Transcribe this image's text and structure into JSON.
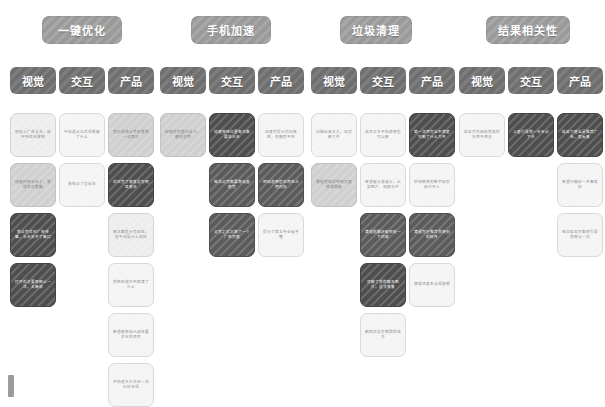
{
  "board": {
    "title": "产品体验亲和图",
    "groups": [
      {
        "label": "一键优化",
        "x": 42,
        "width": 80
      },
      {
        "label": "手机加速",
        "x": 191,
        "width": 80
      },
      {
        "label": "垃圾清理",
        "x": 340,
        "width": 72
      },
      {
        "label": "结果相关性",
        "x": 486,
        "width": 84
      }
    ],
    "columns": [
      {
        "label": "视觉",
        "x": 10
      },
      {
        "label": "交互",
        "x": 59
      },
      {
        "label": "产品",
        "x": 108
      },
      {
        "label": "视觉",
        "x": 160
      },
      {
        "label": "交互",
        "x": 209
      },
      {
        "label": "产品",
        "x": 258
      },
      {
        "label": "视觉",
        "x": 311
      },
      {
        "label": "交互",
        "x": 360
      },
      {
        "label": "产品",
        "x": 409
      },
      {
        "label": "视觉",
        "x": 459
      },
      {
        "label": "交互",
        "x": 508
      },
      {
        "label": "产品",
        "x": 557
      }
    ],
    "notes": [
      {
        "x": 10,
        "y": 113,
        "shade": "light",
        "text": "视觉上广告太多，找不到优化按钮"
      },
      {
        "x": 10,
        "y": 163,
        "shade": "mid",
        "text": "动画时间太长了，等得有点焦躁"
      },
      {
        "x": 10,
        "y": 213,
        "shade": "darker",
        "text": "我点完优化广告弹窗，半天关不了窗口"
      },
      {
        "x": 10,
        "y": 263,
        "shade": "darker",
        "text": "打开后还要再确认一次，太麻烦"
      },
      {
        "x": 59,
        "y": 113,
        "shade": "lightest",
        "text": "不知道点击后系统做了什么"
      },
      {
        "x": 59,
        "y": 163,
        "shade": "lightest",
        "text": "按钮点了没反应"
      },
      {
        "x": 108,
        "y": 113,
        "shade": "mid",
        "text": "我只是想让手机变快一点而已"
      },
      {
        "x": 108,
        "y": 163,
        "shade": "darker",
        "text": "优化完了速度没有明显变化"
      },
      {
        "x": 108,
        "y": 213,
        "shade": "light",
        "text": "每次都提示有风险，但不说是什么风险"
      },
      {
        "x": 108,
        "y": 263,
        "shade": "lightest",
        "text": "我想知道它到底清了什么"
      },
      {
        "x": 108,
        "y": 313,
        "shade": "lightest",
        "text": "希望能够自己选择要优化的项目"
      },
      {
        "x": 108,
        "y": 363,
        "shade": "lightest",
        "text": "不知道多久优化一次比较合适"
      },
      {
        "x": 160,
        "y": 113,
        "shade": "mid",
        "text": "加速后页面还是卡，感觉没用"
      },
      {
        "x": 209,
        "y": 113,
        "shade": "darker",
        "text": "加速按钮位置每次都要找半天"
      },
      {
        "x": 209,
        "y": 163,
        "shade": "dark",
        "text": "每次点完都要等动画跑完"
      },
      {
        "x": 209,
        "y": 213,
        "shade": "dark",
        "text": "点完之后又跳了一个广告页面"
      },
      {
        "x": 258,
        "y": 113,
        "shade": "lightest",
        "text": "加速完提示内存释放，但感受不到"
      },
      {
        "x": 258,
        "y": 163,
        "shade": "dark",
        "text": "想知道哪些应用在占用内存"
      },
      {
        "x": 258,
        "y": 213,
        "shade": "lightest",
        "text": "提示文案太专业看不懂"
      },
      {
        "x": 311,
        "y": 113,
        "shade": "lightest",
        "text": "扫描出来太大，怕误删文件"
      },
      {
        "x": 311,
        "y": 163,
        "shade": "mid",
        "text": "清理完成后空间又很快满回来"
      },
      {
        "x": 360,
        "y": 113,
        "shade": "lightest",
        "text": "选项太多不知道哪些可以删"
      },
      {
        "x": 360,
        "y": 163,
        "shade": "lightest",
        "text": "希望能分类展示，比如图片、视频分开"
      },
      {
        "x": 360,
        "y": 213,
        "shade": "dark",
        "text": "清理前最好能预览一下内容"
      },
      {
        "x": 360,
        "y": 263,
        "shade": "darker",
        "text": "误删了我的聊天图片，没法恢复"
      },
      {
        "x": 360,
        "y": 313,
        "shade": "lightest",
        "text": "删除后没有撤回的地方"
      },
      {
        "x": 409,
        "y": 113,
        "shade": "darker",
        "text": "第一次用完全不清楚它删了什么文件"
      },
      {
        "x": 409,
        "y": 163,
        "shade": "lightest",
        "text": "空间释放的数字和实际对不上"
      },
      {
        "x": 409,
        "y": 213,
        "shade": "dark",
        "text": "清理完还推荐我装别的软件"
      },
      {
        "x": 409,
        "y": 263,
        "shade": "lightest",
        "text": "清理进度条走得很慢"
      },
      {
        "x": 459,
        "y": 113,
        "shade": "lightest",
        "text": "结果页内容和我搜的东西不相关"
      },
      {
        "x": 508,
        "y": 113,
        "shade": "darker",
        "text": "上面引导我一步步点下去"
      },
      {
        "x": 557,
        "y": 113,
        "shade": "darker",
        "text": "结果下面全是推荐广告，很反感"
      },
      {
        "x": 557,
        "y": 163,
        "shade": "lightest",
        "text": "希望只做好一件事就好"
      },
      {
        "x": 557,
        "y": 213,
        "shade": "lightest",
        "text": "每次结果页都想引导我再点一次"
      }
    ],
    "scroll_nub": "vertical-scroll-indicator"
  }
}
